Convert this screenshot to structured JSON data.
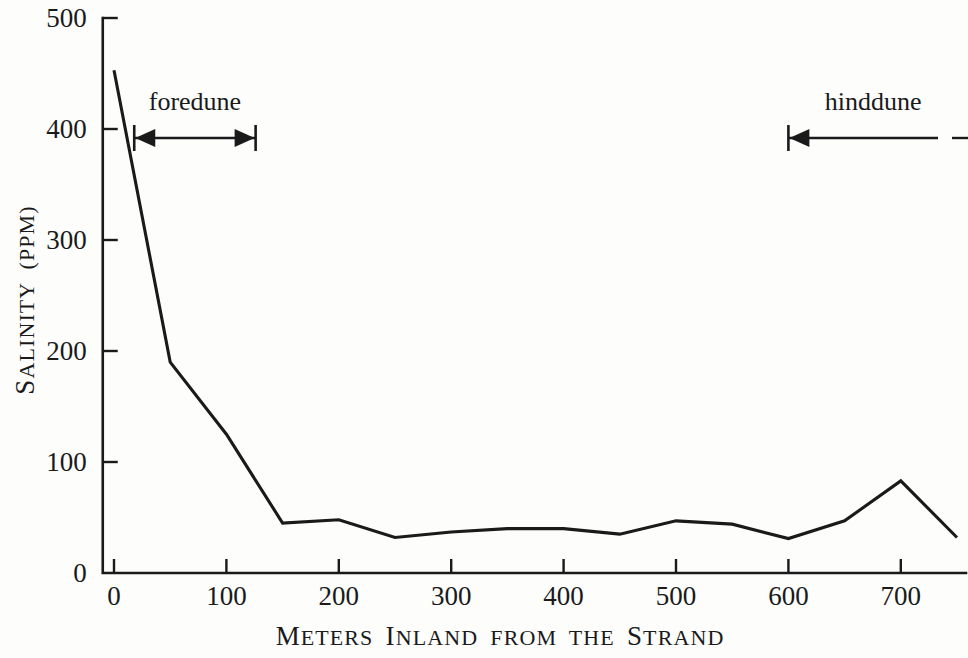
{
  "chart_data": {
    "type": "line",
    "title": "",
    "xlabel": "Meters Inland from the Strand",
    "ylabel": "Salinity (PPM)",
    "xlim": [
      -12,
      765
    ],
    "ylim": [
      0,
      500
    ],
    "grid": false,
    "legend": "none",
    "x": [
      0,
      50,
      100,
      150,
      200,
      250,
      300,
      350,
      400,
      450,
      500,
      550,
      600,
      650,
      700,
      750
    ],
    "values": [
      453,
      190,
      125,
      45,
      48,
      32,
      37,
      40,
      40,
      35,
      47,
      44,
      31,
      47,
      83,
      32
    ],
    "series": [
      {
        "name": "Salinity",
        "values": [
          453,
          190,
          125,
          45,
          48,
          32,
          37,
          40,
          40,
          35,
          47,
          44,
          31,
          47,
          83,
          32
        ]
      }
    ],
    "xticks": [
      0,
      100,
      200,
      300,
      400,
      500,
      600,
      700
    ],
    "xtick_labels": [
      "0",
      "100",
      "200",
      "300",
      "400",
      "500",
      "600",
      "700"
    ],
    "yticks": [
      0,
      100,
      200,
      300,
      400,
      500
    ],
    "ytick_labels": [
      "0",
      "100",
      "200",
      "300",
      "400",
      "500"
    ],
    "annotations": [
      {
        "label": "foredune",
        "style": "double-arrow-bracket",
        "x_start": 18,
        "x_end": 126,
        "y": 400
      },
      {
        "label": "hinddune",
        "style": "left-arrow-open-right",
        "x_start": 600,
        "x_end": 765,
        "y": 400
      }
    ]
  },
  "axes": {
    "x_title": "Meters Inland from the Strand",
    "x_title_caps": [
      "M",
      "I",
      "S"
    ],
    "y_title": "Salinity (PPM)"
  },
  "annotations": {
    "foredune_label": "foredune",
    "hinddune_label": "hinddune"
  },
  "colors": {
    "line": "#1a1a1a",
    "axis": "#1a1a1a",
    "background": "#fdfdfc"
  }
}
